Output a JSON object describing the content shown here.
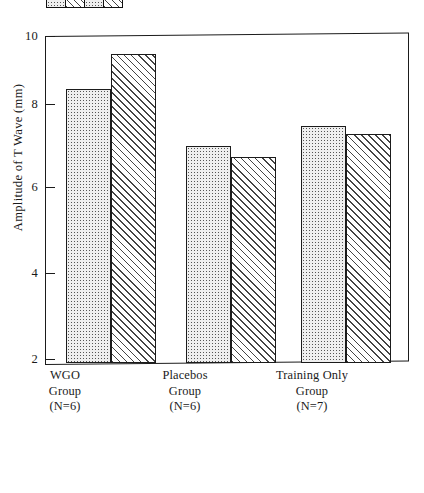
{
  "legend": {
    "swatches": [
      {
        "name": "pre-training-swatch",
        "pattern": "dotted"
      },
      {
        "name": "post-training-swatch",
        "pattern": "hatched"
      },
      {
        "name": "legend-swatch-3",
        "pattern": "dotted"
      },
      {
        "name": "legend-swatch-4",
        "pattern": "hatched"
      }
    ]
  },
  "axis": {
    "y_label": "Amplitude of T Wave (mm)",
    "y_ticks": [
      "10",
      "8",
      "6",
      "4",
      "2"
    ]
  },
  "groups": [
    {
      "name": "WGO",
      "line1": "WGO",
      "line2": "Group",
      "line3": "(N=6)"
    },
    {
      "name": "Placebos",
      "line1": "Placebos",
      "line2": "Group",
      "line3": "(N=6)"
    },
    {
      "name": "Training Only",
      "line1": "Training Only",
      "line2": "Group",
      "line3": "(N=7)"
    }
  ],
  "chart_data": {
    "type": "bar",
    "title": "",
    "xlabel": "",
    "ylabel": "Amplitude of T Wave (mm)",
    "ylim": [
      0,
      10
    ],
    "yticks": [
      2,
      4,
      6,
      8,
      10
    ],
    "grid": false,
    "legend_position": "top-left",
    "categories": [
      "WGO Group (N=6)",
      "Placebos Group (N=6)",
      "Training Only Group (N=7)"
    ],
    "series": [
      {
        "name": "dotted",
        "pattern": "dotted",
        "values": [
          6.7,
          5.3,
          5.8
        ]
      },
      {
        "name": "hatched",
        "pattern": "diagonal-hatch",
        "values": [
          7.55,
          5.05,
          5.6
        ]
      }
    ]
  },
  "colors": {
    "axis": "#1b1b1b",
    "bar_outline": "#1b1b1b",
    "dotted_fill": "#efefef",
    "hatched_fill": "#ffffff",
    "background": "#ffffff"
  }
}
